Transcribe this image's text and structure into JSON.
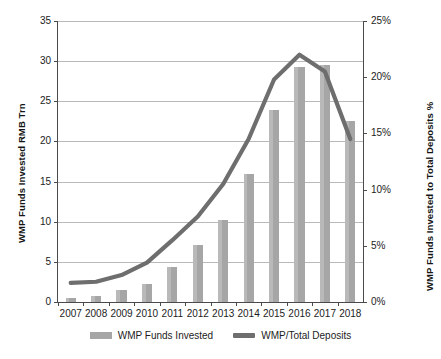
{
  "chart_data": {
    "type": "bar",
    "title": "",
    "xlabel": "",
    "categories": [
      "2007",
      "2008",
      "2009",
      "2010",
      "2011",
      "2012",
      "2013",
      "2014",
      "2015",
      "2016",
      "2017",
      "2018"
    ],
    "grid": true,
    "legend_position": "bottom",
    "series": [
      {
        "name": "WMP Funds Invested",
        "type": "bar",
        "axis": "left",
        "unit": "RMB Trn",
        "color": "#a6a6a6",
        "values": [
          0.5,
          0.8,
          1.5,
          2.3,
          4.3,
          7.1,
          10.2,
          16.0,
          23.9,
          29.3,
          29.5,
          22.5
        ]
      },
      {
        "name": "WMP/Total Deposits",
        "type": "line",
        "axis": "right",
        "unit": "%",
        "color": "#6e6e6e",
        "values": [
          1.7,
          1.8,
          2.4,
          3.5,
          5.5,
          7.6,
          10.5,
          14.5,
          19.8,
          22.0,
          20.5,
          14.5
        ]
      }
    ],
    "left_axis": {
      "label": "WMP Funds Invested RMB Trn",
      "min": 0,
      "max": 35,
      "ticks": [
        0,
        5,
        10,
        15,
        20,
        25,
        30,
        35
      ],
      "tick_labels": [
        "0",
        "5",
        "10",
        "15",
        "20",
        "25",
        "30",
        "35"
      ]
    },
    "right_axis": {
      "label": "WMP Funds Invested to Total Deposits %",
      "min": 0,
      "max": 25,
      "ticks": [
        0,
        5,
        10,
        15,
        20,
        25
      ],
      "tick_labels": [
        "0%",
        "5%",
        "10%",
        "15%",
        "20%",
        "25%"
      ]
    },
    "legend": [
      {
        "label": "WMP Funds Invested",
        "marker": "bar",
        "color": "#a6a6a6"
      },
      {
        "label": "WMP/Total Deposits",
        "marker": "line",
        "color": "#6e6e6e"
      }
    ]
  }
}
